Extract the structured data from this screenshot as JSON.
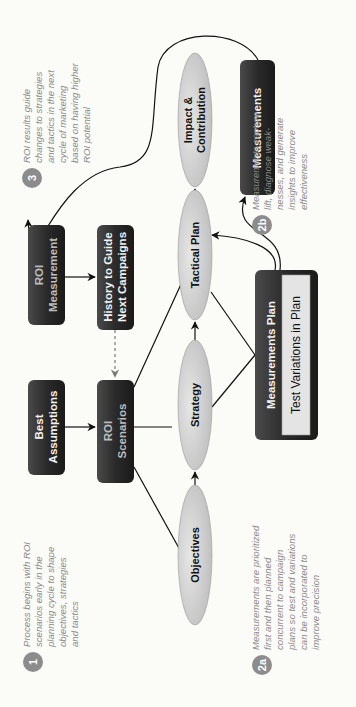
{
  "diagram": {
    "boxes": {
      "roi_measurement": {
        "line1": "ROI",
        "line2": "Measurement"
      },
      "history": {
        "line1": "History to Guide",
        "line2": "Next Campaigns"
      },
      "best_assumptions": {
        "line1": "Best",
        "line2": "Assumptions"
      },
      "roi_scenarios": {
        "line1": "ROI",
        "line2": "Scenarios"
      },
      "measurements": {
        "label": "Measurements"
      },
      "measurements_plan": {
        "label": "Measurements Plan",
        "inner_label": "Test Variations in Plan"
      }
    },
    "ellipses": {
      "impact": {
        "line1": "Impact &",
        "line2": "Contribution"
      },
      "tactical": {
        "label": "Tactical Plan"
      },
      "strategy": {
        "label": "Strategy"
      },
      "objectives": {
        "label": "Objectives"
      }
    },
    "notes": {
      "n1": {
        "badge": "1",
        "lines": [
          "Process begins with ROI",
          "scenarios early in the",
          "planning cycle to shape",
          "objectives, strategies",
          "and tactics"
        ]
      },
      "n3": {
        "badge": "3",
        "lines": [
          "ROI results guide",
          "changes to strategies",
          "and tactics in the next",
          "cycle of marketing",
          "based on having higher",
          "ROI potential"
        ]
      },
      "n2a": {
        "badge": "2a",
        "lines": [
          "Measurements are prioritized",
          "first and then planned",
          "concurrent to campaign",
          "plans so test and variations",
          "can be incorporated to",
          "improve precision"
        ]
      },
      "n2b": {
        "badge": "2b",
        "lines": [
          "Measurements capture",
          "lift, diagnose weak-",
          "nesses, and generate",
          "insights to improve",
          "effectiveness"
        ]
      }
    },
    "colors": {
      "box_dark": "#2e2e2e",
      "ellipse_fill": "#d6d6d6",
      "badge": "#8c8c8c",
      "note_text": "#8a8a8a"
    }
  }
}
